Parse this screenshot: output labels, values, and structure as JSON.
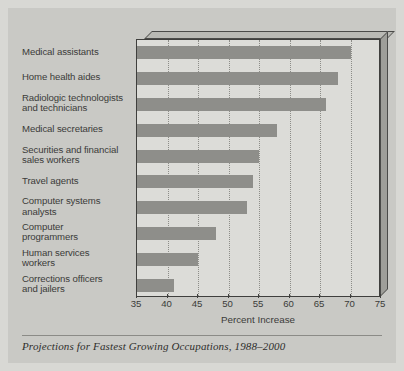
{
  "figure": {
    "caption": "Projections for Fastest Growing Occupations, 1988–2000",
    "background_color": "#c9c9c5",
    "plot_face_color": "#dcdcd8",
    "bar_color": "#8e8e8a"
  },
  "chart_data": {
    "type": "bar",
    "orientation": "horizontal",
    "title": "",
    "xlabel": "Percent Increase",
    "ylabel": "",
    "xlim": [
      35,
      75
    ],
    "xticks": [
      35,
      40,
      45,
      50,
      55,
      60,
      65,
      70,
      75
    ],
    "grid": "vertical-dotted",
    "legend": "none",
    "categories": [
      "Medical assistants",
      "Home health aides",
      "Radiologic technologists and technicians",
      "Medical secretaries",
      "Securities and financial sales workers",
      "Travel agents",
      "Computer systems analysts",
      "Computer programmers",
      "Human services workers",
      "Corrections officers and jailers"
    ],
    "category_lines": [
      [
        "Medical assistants"
      ],
      [
        "Home health aides"
      ],
      [
        "Radiologic technologists",
        "and technicians"
      ],
      [
        "Medical secretaries"
      ],
      [
        "Securities and financial",
        "sales workers"
      ],
      [
        "Travel agents"
      ],
      [
        "Computer systems",
        "analysts"
      ],
      [
        "Computer",
        "programmers"
      ],
      [
        "Human services",
        "workers"
      ],
      [
        "Corrections officers",
        "and jailers"
      ]
    ],
    "values": [
      70,
      68,
      66,
      58,
      55,
      54,
      53,
      48,
      45,
      41
    ]
  }
}
